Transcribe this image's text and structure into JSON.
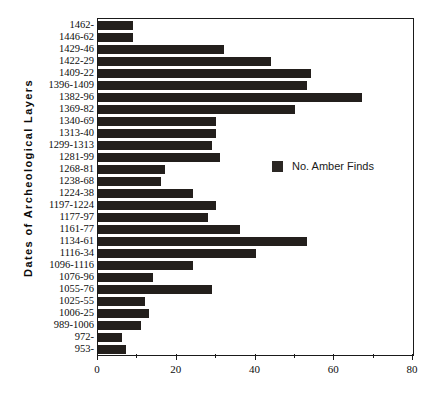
{
  "chart_data": {
    "type": "bar",
    "orientation": "horizontal",
    "title": "",
    "xlabel": "",
    "ylabel": "Dates  of  Archeological  Layers",
    "xlim": [
      0,
      80
    ],
    "ylim": null,
    "grid": false,
    "legend_position": "inside-right",
    "bar_color": "#231f1c",
    "axis_color": "#1a1a1a",
    "xticks": [
      0,
      10,
      20,
      30,
      40,
      50,
      60,
      70,
      80
    ],
    "xticklabels": [
      "0",
      "",
      "20",
      "",
      "40",
      "",
      "60",
      "",
      "80"
    ],
    "series": [
      {
        "name": "No. Amber Finds",
        "values": [
          9,
          9,
          32,
          44,
          54,
          53,
          67,
          50,
          30,
          30,
          29,
          31,
          17,
          16,
          24,
          30,
          28,
          36,
          53,
          40,
          24,
          14,
          29,
          12,
          13,
          11,
          6,
          7
        ]
      }
    ],
    "categories": [
      "1462-",
      "1446-62",
      "1429-46",
      "1422-29",
      "1409-22",
      "1396-1409",
      "1382-96",
      "1369-82",
      "1340-69",
      "1313-40",
      "1299-1313",
      "1281-99",
      "1268-81",
      "1238-68",
      "1224-38",
      "1197-1224",
      "1177-97",
      "1161-77",
      "1134-61",
      "1116-34",
      "1096-1116",
      "1076-96",
      "1055-76",
      "1025-55",
      "1006-25",
      "989-1006",
      "972-",
      "953-"
    ]
  },
  "legend": {
    "label": "No. Amber Finds"
  }
}
